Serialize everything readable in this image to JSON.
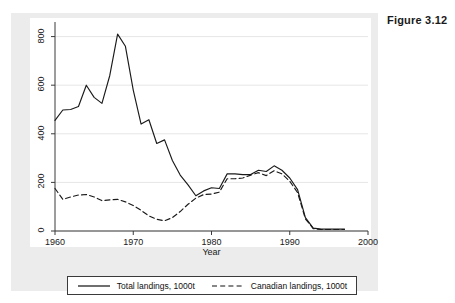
{
  "figure": {
    "number_label": "Figure 3.12"
  },
  "legend": {
    "position": "below-axis",
    "entries": [
      {
        "label": "Total landings, 1000t",
        "style": "solid"
      },
      {
        "label": "Canadian landings, 1000t",
        "style": "dashed"
      }
    ]
  },
  "axes": {
    "x": {
      "title": "Year",
      "ticks": [
        "1960",
        "1970",
        "1980",
        "1990",
        "2000"
      ],
      "min": 1960,
      "max": 2000
    },
    "y": {
      "title": "",
      "ticks": [
        "0",
        "200",
        "400",
        "600",
        "800"
      ],
      "min": 0,
      "max": 860
    }
  },
  "colors": {
    "line": "#1a1a1a",
    "grid": "#e6e6e6",
    "axis": "#3a3a3a",
    "plot_background": "#ffffff",
    "panel_background": "#ececec",
    "page_background": "#ffffff",
    "text": "#202020"
  },
  "chart_data": {
    "type": "line",
    "title": "",
    "subtitle": "",
    "xlabel": "Year",
    "ylabel": "",
    "xlim": [
      1960,
      2000
    ],
    "ylim": [
      0,
      860
    ],
    "grid": true,
    "grid_axis": "y",
    "legend_position": "bottom",
    "x": [
      1960,
      1961,
      1962,
      1963,
      1964,
      1965,
      1966,
      1967,
      1968,
      1969,
      1970,
      1971,
      1972,
      1973,
      1974,
      1975,
      1976,
      1977,
      1978,
      1979,
      1980,
      1981,
      1982,
      1983,
      1984,
      1985,
      1986,
      1987,
      1988,
      1989,
      1990,
      1991,
      1992,
      1993,
      1994,
      1995,
      1996,
      1997
    ],
    "series": [
      {
        "name": "Total landings, 1000t",
        "style": "solid",
        "values": [
          455,
          498,
          500,
          512,
          600,
          550,
          525,
          640,
          810,
          760,
          580,
          440,
          458,
          360,
          375,
          290,
          230,
          190,
          145,
          165,
          178,
          175,
          235,
          235,
          232,
          232,
          250,
          245,
          268,
          250,
          218,
          170,
          55,
          12,
          8,
          8,
          8,
          8
        ]
      },
      {
        "name": "Canadian landings, 1000t",
        "style": "dashed",
        "values": [
          175,
          130,
          140,
          148,
          150,
          140,
          125,
          128,
          130,
          120,
          105,
          85,
          62,
          48,
          42,
          55,
          80,
          110,
          135,
          150,
          152,
          160,
          215,
          215,
          218,
          230,
          240,
          228,
          248,
          235,
          205,
          158,
          50,
          10,
          6,
          6,
          6,
          6
        ]
      }
    ]
  }
}
